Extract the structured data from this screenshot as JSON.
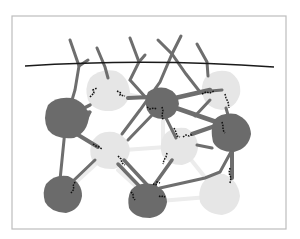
{
  "diagram": {
    "title": "",
    "colors": {
      "frame_border": "#bdbdbd",
      "dark_node": "#6b6b6b",
      "light_node": "#e6e6e6",
      "strand": "#6e6e6e",
      "pale_strand": "#ececec",
      "surface_line": "#1a1a1a",
      "crosslink": "#111111"
    },
    "frame": {
      "x": 12,
      "y": 16,
      "width": 274,
      "height": 213
    },
    "surface_line": {
      "path": "M25,66 Q150,58 274,67"
    },
    "dark_nodes": [
      {
        "id": "d1",
        "cx": 67,
        "cy": 117,
        "r": 22
      },
      {
        "id": "d2",
        "cx": 163,
        "cy": 102,
        "r": 17
      },
      {
        "id": "d3",
        "cx": 232,
        "cy": 131,
        "r": 20
      },
      {
        "id": "d4",
        "cx": 63,
        "cy": 194,
        "r": 20
      },
      {
        "id": "d5",
        "cx": 148,
        "cy": 202,
        "r": 20
      }
    ],
    "light_nodes": [
      {
        "id": "l1",
        "cx": 108,
        "cy": 90,
        "r": 21
      },
      {
        "id": "l2",
        "cx": 222,
        "cy": 90,
        "r": 19
      },
      {
        "id": "l3",
        "cx": 110,
        "cy": 151,
        "r": 20
      },
      {
        "id": "l4",
        "cx": 180,
        "cy": 146,
        "r": 19
      },
      {
        "id": "l5",
        "cx": 220,
        "cy": 196,
        "r": 20
      }
    ],
    "labels": []
  }
}
